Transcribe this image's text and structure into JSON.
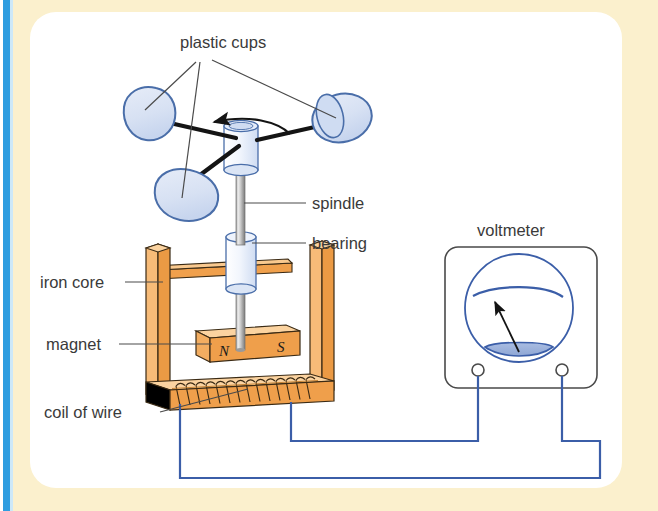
{
  "figure": {
    "type": "labelled-science-diagram",
    "canvas": {
      "width": 658,
      "height": 511
    }
  },
  "page_frame": {
    "left_rule_color": "#2f9de0",
    "band_color": "#fbf0cd",
    "content_color": "#ffffff"
  },
  "palette": {
    "wood_orange_light": "#f5a855",
    "wood_orange_mid": "#e8903a",
    "wood_orange_dark": "#d97b28",
    "wood_outline": "#3a2a14",
    "plastic_fill": "#dbe5f5",
    "plastic_fill_dark": "#c2d2ec",
    "plastic_outline": "#4a6ea9",
    "metal_light": "#e8e8e8",
    "metal_mid": "#b8b8b8",
    "metal_dark": "#8c8c8c",
    "wire_blue": "#3b5ea8",
    "meter_outline": "#4a4a4a",
    "dial_blue": "#3b5ea8",
    "dial_fill": "#9fb4dd",
    "leader_grey": "#4a4a4a",
    "arm_black": "#141414",
    "label_text": "#3a3a3a"
  },
  "labels": {
    "plastic_cups": "plastic cups",
    "spindle": "spindle",
    "bearing": "bearing",
    "iron_core": "iron core",
    "magnet": "magnet",
    "coil_of_wire": "coil of wire",
    "voltmeter": "voltmeter"
  },
  "magnet_poles": {
    "north": "N",
    "south": "S"
  },
  "components": {
    "cups": [
      {
        "id": "cup-left",
        "shape": "rounded-triangle",
        "cx": 147,
        "cy": 116
      },
      {
        "id": "cup-right",
        "shape": "ellipse-open",
        "cx": 341,
        "cy": 118
      },
      {
        "id": "cup-bottom",
        "shape": "rounded-blob",
        "cx": 185,
        "cy": 195
      }
    ],
    "hub": {
      "id": "hub-cylinder",
      "cx": 240,
      "cy": 150
    },
    "spindle": {
      "id": "spindle-rod",
      "x": 240,
      "top": 165,
      "bottom": 345
    },
    "bearing": {
      "id": "bearing-cylinder",
      "cx": 240,
      "cy": 262
    },
    "magnet": {
      "id": "bar-magnet",
      "cx": 244,
      "cy": 345
    },
    "iron_core": {
      "id": "iron-core-frame",
      "shape": "U-frame"
    },
    "coil": {
      "id": "wire-coil",
      "turns": 14
    },
    "voltmeter": {
      "id": "voltmeter-box",
      "x": 445,
      "y": 247,
      "w": 152,
      "h": 141,
      "needle_angle_deg": -68,
      "terminals": 2
    }
  },
  "rotation_arrow": {
    "id": "rotation-direction-arrow",
    "direction": "anticlockwise"
  }
}
